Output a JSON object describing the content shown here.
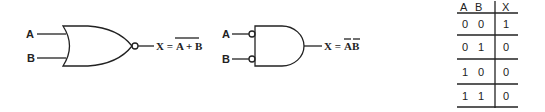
{
  "nor_gate": {
    "input_a": "A",
    "input_b": "B",
    "output_lhs": "X =",
    "output_expr": "A + B",
    "expr_overbar": "full"
  },
  "and_gate_inverted_inputs": {
    "input_a": "A",
    "input_b": "B",
    "output_lhs": "X =",
    "output_expr_a": "A",
    "output_expr_b": "B"
  },
  "truth_table": {
    "headers": [
      "A",
      "B",
      "X"
    ],
    "rows": [
      [
        "0",
        "0",
        "1"
      ],
      [
        "0",
        "1",
        "0"
      ],
      [
        "1",
        "0",
        "0"
      ],
      [
        "1",
        "1",
        "0"
      ]
    ]
  }
}
